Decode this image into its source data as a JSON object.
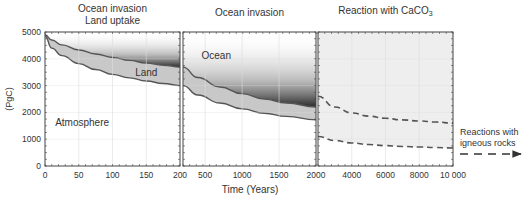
{
  "chart_data": {
    "type": "area",
    "ylabel": "(PgC)",
    "xlabel": "Time (Years)",
    "ylim": [
      0,
      5000
    ],
    "yticks": [
      0,
      1000,
      2000,
      3000,
      4000,
      5000
    ],
    "grid": true,
    "panels": [
      {
        "title_lines": [
          "Ocean invasion",
          "Land uptake"
        ],
        "xlim": [
          0,
          200
        ],
        "xticks": [
          0,
          50,
          100,
          150,
          200
        ],
        "xtick_labels": [
          "0",
          "50",
          "100",
          "150",
          "200"
        ],
        "series": [
          {
            "name": "Land upper boundary",
            "x": [
              0,
              10,
              25,
              50,
              75,
              100,
              125,
              150,
              175,
              200
            ],
            "values": [
              4900,
              4700,
              4520,
              4330,
              4180,
              4050,
              3940,
              3840,
              3760,
              3690
            ]
          },
          {
            "name": "Land lower boundary",
            "x": [
              0,
              10,
              25,
              50,
              75,
              100,
              125,
              150,
              175,
              200
            ],
            "values": [
              4850,
              4400,
              4120,
              3820,
              3600,
              3420,
              3290,
              3170,
              3080,
              3000
            ]
          }
        ],
        "labels": [
          {
            "text": "Land",
            "x": 150,
            "y": 3350
          },
          {
            "text": "Atmosphere",
            "x": 55,
            "y": 1500
          }
        ]
      },
      {
        "title_lines": [
          "Ocean invasion"
        ],
        "xlim": [
          200,
          2000
        ],
        "xticks": [
          200,
          500,
          1000,
          1500,
          2000
        ],
        "xtick_labels": [
          "200",
          "500",
          "1000",
          "1500",
          "2000"
        ],
        "series": [
          {
            "name": "Land upper boundary",
            "x": [
              200,
              400,
              700,
              1000,
              1300,
              1600,
              2000
            ],
            "values": [
              3690,
              3300,
              2950,
              2700,
              2500,
              2350,
              2200
            ]
          },
          {
            "name": "Land lower boundary",
            "x": [
              200,
              400,
              700,
              1000,
              1300,
              1600,
              2000
            ],
            "values": [
              3000,
              2650,
              2350,
              2130,
              1970,
              1850,
              1720
            ]
          }
        ],
        "labels": [
          {
            "text": "Ocean",
            "x": 650,
            "y": 4000
          }
        ]
      },
      {
        "title_lines": [
          "Reaction with CaCO",
          "3"
        ],
        "xlim": [
          2000,
          10000
        ],
        "xticks": [
          2000,
          4000,
          6000,
          8000,
          10000
        ],
        "xtick_labels": [
          "2000",
          "4000",
          "6000",
          "8000",
          "10 000"
        ],
        "series": [
          {
            "name": "Upper dashed",
            "style": "dashed",
            "x": [
              2000,
              3000,
              4000,
              5000,
              6000,
              7000,
              8000,
              9000,
              10000
            ],
            "values": [
              2600,
              2200,
              1980,
              1860,
              1780,
              1720,
              1680,
              1640,
              1600
            ]
          },
          {
            "name": "Lower dashed",
            "style": "dashed",
            "x": [
              2000,
              3000,
              4000,
              5000,
              6000,
              7000,
              8000,
              9000,
              10000
            ],
            "values": [
              1100,
              950,
              860,
              800,
              760,
              730,
              710,
              690,
              670
            ]
          }
        ],
        "labels": []
      }
    ],
    "annotation": {
      "lines": [
        "Reactions with",
        "igneous rocks"
      ],
      "arrow": "dashed-right"
    }
  },
  "colors": {
    "axis": "#444444",
    "curve": "#555555",
    "land_fill": "#c8c8c8",
    "ocean_dark": "#1a1a1a",
    "panel3_bg": "#eeeeee",
    "grid": "#dddddd"
  }
}
